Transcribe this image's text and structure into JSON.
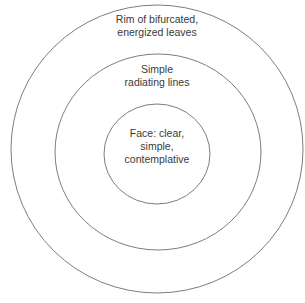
{
  "diagram": {
    "type": "concentric-circles",
    "rings": [
      {
        "id": "outer",
        "label_lines": [
          "Rim of bifurcated,",
          "energized leaves"
        ],
        "cx": 157,
        "cy": 149,
        "rx": 146,
        "ry": 144
      },
      {
        "id": "middle",
        "label_lines": [
          "Simple",
          "radiating lines"
        ],
        "cx": 158,
        "cy": 152,
        "rx": 103,
        "ry": 98
      },
      {
        "id": "inner",
        "label_lines": [
          "Face: clear,",
          "simple,",
          "contemplative"
        ],
        "cx": 157,
        "cy": 154,
        "rx": 53,
        "ry": 50
      }
    ],
    "stroke_color": "#6e6e6e",
    "text_color": "#3a3a3a",
    "background": "#ffffff"
  }
}
